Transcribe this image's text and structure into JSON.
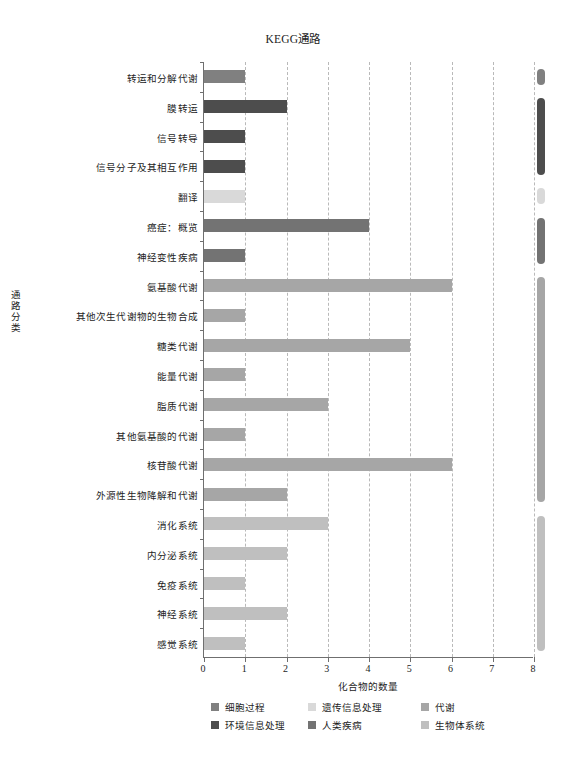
{
  "chart_data": {
    "type": "bar",
    "orientation": "horizontal",
    "title": "KEGG通路",
    "xlabel": "化合物的数量",
    "ylabel": "通路分类",
    "xlim": [
      0,
      8
    ],
    "xticks": [
      "0",
      "1",
      "2",
      "3",
      "4",
      "5",
      "6",
      "7",
      "8"
    ],
    "grid": "vertical-dashed",
    "legend_position": "bottom",
    "categories": [
      "转运和分解代谢",
      "膜转运",
      "信号转导",
      "信号分子及其相互作用",
      "翻译",
      "癌症：概览",
      "神经变性疾病",
      "氨基酸代谢",
      "其他次生代谢物的生物合成",
      "糖类代谢",
      "能量代谢",
      "脂质代谢",
      "其他氨基酸的代谢",
      "核苷酸代谢",
      "外源性生物降解和代谢",
      "消化系统",
      "内分泌系统",
      "免疫系统",
      "神经系统",
      "感觉系统"
    ],
    "values": [
      1,
      2,
      1,
      1,
      1,
      4,
      1,
      6,
      1,
      5,
      1,
      3,
      1,
      6,
      2,
      3,
      2,
      1,
      2,
      1
    ],
    "groups": [
      "细胞过程",
      "环境信息处理",
      "环境信息处理",
      "环境信息处理",
      "遗传信息处理",
      "人类疾病",
      "人类疾病",
      "代谢",
      "代谢",
      "代谢",
      "代谢",
      "代谢",
      "代谢",
      "代谢",
      "代谢",
      "生物体系统",
      "生物体系统",
      "生物体系统",
      "生物体系统",
      "生物体系统"
    ],
    "legend": [
      {
        "label": "细胞过程",
        "color": "#808080"
      },
      {
        "label": "环境信息处理",
        "color": "#4d4d4d"
      },
      {
        "label": "遗传信息处理",
        "color": "#d9d9d9"
      },
      {
        "label": "人类疾病",
        "color": "#737373"
      },
      {
        "label": "代谢",
        "color": "#a6a6a6"
      },
      {
        "label": "生物体系统",
        "color": "#bfbfbf"
      }
    ],
    "group_strip": [
      {
        "group": "细胞过程",
        "color": "#808080",
        "start_index": 0,
        "end_index": 0
      },
      {
        "group": "环境信息处理",
        "color": "#4d4d4d",
        "start_index": 1,
        "end_index": 3
      },
      {
        "group": "遗传信息处理",
        "color": "#d9d9d9",
        "start_index": 4,
        "end_index": 4
      },
      {
        "group": "人类疾病",
        "color": "#737373",
        "start_index": 5,
        "end_index": 6
      },
      {
        "group": "代谢",
        "color": "#a6a6a6",
        "start_index": 7,
        "end_index": 14
      },
      {
        "group": "生物体系统",
        "color": "#bfbfbf",
        "start_index": 15,
        "end_index": 19
      }
    ]
  }
}
